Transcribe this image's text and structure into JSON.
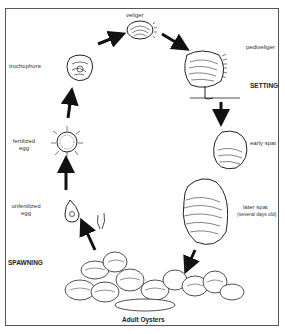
{
  "stages": {
    "veliger": "veliger",
    "pediveliger": "pediveliger",
    "setting": "SETTING",
    "early_spat": "early spat",
    "later_spat": "later spat",
    "later_spat_note": "(several days old)",
    "adult": "Adult Oysters",
    "spawning": "SPAWNING",
    "unfertilized_1": "unfertilized",
    "unfertilized_2": "egg",
    "fertilized_1": "fertilized",
    "fertilized_2": "egg",
    "trochophore": "trochophore"
  },
  "colors": {
    "ink": "#222222",
    "frame": "#555555",
    "background": "#ffffff"
  }
}
